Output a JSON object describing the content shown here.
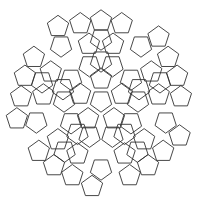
{
  "diagram": {
    "type": "penrose-pentagon-tiling",
    "symmetry": 5,
    "center": [
      101,
      101
    ],
    "tile_radius": 11.2,
    "stroke_color": "#333333",
    "background": "#ffffff",
    "sector_tiles": [
      {
        "d": 22,
        "a": -90,
        "rot": 0
      },
      {
        "d": 37,
        "a": -108,
        "rot": 36
      },
      {
        "d": 37,
        "a": -72,
        "rot": 36
      },
      {
        "d": 40,
        "a": -90,
        "rot": 36
      },
      {
        "d": 58,
        "a": -102,
        "rot": 0
      },
      {
        "d": 58,
        "a": -78,
        "rot": 0
      },
      {
        "d": 80,
        "a": -105,
        "rot": 0
      },
      {
        "d": 80,
        "a": -90,
        "rot": 0
      },
      {
        "d": 80,
        "a": -75,
        "rot": 0
      },
      {
        "d": 68,
        "a": -126,
        "rot": 36
      },
      {
        "d": 86,
        "a": -120,
        "rot": 0
      },
      {
        "d": 62,
        "a": -90,
        "rot": 36
      }
    ],
    "center_tile": {
      "rot": 36
    }
  }
}
